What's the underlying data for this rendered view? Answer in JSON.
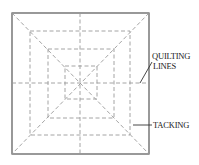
{
  "diagram": {
    "type": "quilting-pattern",
    "colors": {
      "outline": "#555555",
      "dashed": "#9a9a9a",
      "label": "#222222",
      "leader": "#333333"
    },
    "outer_square": {
      "x": 12,
      "y": 13,
      "w": 137,
      "h": 141
    },
    "inner_squares": [
      {
        "x": 30,
        "y": 31,
        "w": 100,
        "h": 104
      },
      {
        "x": 48,
        "y": 49,
        "w": 66,
        "h": 69
      },
      {
        "x": 65,
        "y": 66,
        "w": 32,
        "h": 33
      }
    ],
    "center": {
      "x": 80,
      "y": 83
    },
    "labels": {
      "quilting_line1": "QUILTING",
      "quilting_line2": "LINES",
      "tacking": "TACKING"
    }
  }
}
